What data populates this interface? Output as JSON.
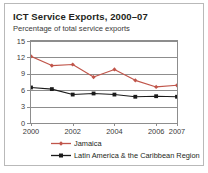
{
  "chart_data": {
    "type": "line",
    "title": "ICT Service Exports, 2000–07",
    "subtitle": "Percentage of total service exports",
    "xlabel": "",
    "ylabel": "",
    "x": [
      2000,
      2001,
      2002,
      2003,
      2004,
      2005,
      2006,
      2007
    ],
    "xtick_labels": [
      "2000",
      "2002",
      "2004",
      "2006",
      "2007"
    ],
    "xtick_values": [
      2000,
      2002,
      2004,
      2006,
      2007
    ],
    "ytick_labels": [
      "0",
      "3",
      "6",
      "9",
      "12",
      "15"
    ],
    "ytick_values": [
      0,
      3,
      6,
      9,
      12,
      15
    ],
    "ylim": [
      0,
      15
    ],
    "xlim": [
      2000,
      2007
    ],
    "grid": "horizontal",
    "legend_position": "below",
    "series": [
      {
        "name": "Jamaica",
        "color": "#c0554a",
        "marker": "diamond",
        "values": [
          12.2,
          10.5,
          10.7,
          8.4,
          9.8,
          7.8,
          6.6,
          6.9
        ]
      },
      {
        "name": "Latin America & the Caribbean Region",
        "color": "#1a1a1a",
        "marker": "square",
        "values": [
          6.5,
          6.2,
          5.2,
          5.4,
          5.2,
          4.8,
          4.9,
          4.8
        ]
      }
    ]
  },
  "figure": {
    "frame_color": "#b9b9b9",
    "axis_color": "#8d8d8d",
    "background": "#ffffff"
  }
}
